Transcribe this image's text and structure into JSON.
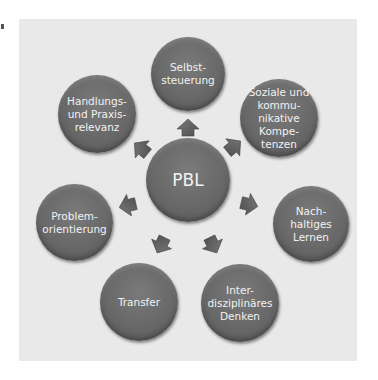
{
  "diagram": {
    "center": {
      "label": "PBL"
    },
    "nodes": [
      {
        "label": "Selbst-\nsteuerung"
      },
      {
        "label": "Soziale und\nkommu-\nnikative\nKompe-\ntenzen"
      },
      {
        "label": "Nach-\nhaltiges\nLernen"
      },
      {
        "label": "Inter-\ndisziplinäres\nDenken"
      },
      {
        "label": "Transfer"
      },
      {
        "label": "Problem-\norientierung"
      },
      {
        "label": "Handlungs-\nund Praxis-\nrelevanz"
      }
    ],
    "colors": {
      "panel": "#e9e9e9",
      "node": "#686868",
      "arrow": "#5e5e5e",
      "text": "#f2f2f2"
    }
  }
}
